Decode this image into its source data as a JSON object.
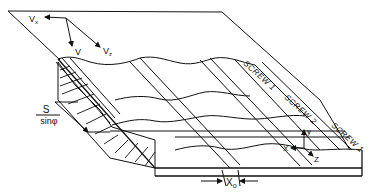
{
  "figure": {
    "type": "isometric engineering drawing"
  },
  "velocity_labels": {
    "vx": "V",
    "vx_sub": "x",
    "v": "V",
    "vz": "V",
    "vz_sub": "z"
  },
  "screw_labels": [
    "SCREW 1",
    "SCREW 2",
    "SCREW 1"
  ],
  "dimension": {
    "numerator": "S",
    "denominator": "sinφ"
  },
  "axes": {
    "x": "X",
    "y": "y",
    "z": "Z"
  },
  "offset": {
    "label": "X",
    "sub": "o"
  }
}
